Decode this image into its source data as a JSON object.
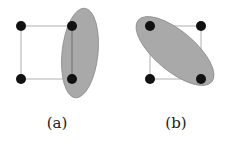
{
  "panels": [
    {
      "label": "(a)",
      "nodes": [
        {
          "id": "top-left",
          "x": 21,
          "y": 26
        },
        {
          "id": "top-right",
          "x": 72,
          "y": 26
        },
        {
          "id": "bottom-left",
          "x": 21,
          "y": 79
        },
        {
          "id": "bottom-right",
          "x": 72,
          "y": 79
        }
      ],
      "region": {
        "shape": "ellipse",
        "cx": 80,
        "cy": 53,
        "rx": 18,
        "ry": 45,
        "rotation": 6,
        "covers": [
          "top-right",
          "bottom-right"
        ]
      }
    },
    {
      "label": "(b)",
      "nodes": [
        {
          "id": "top-left",
          "x": 150,
          "y": 26
        },
        {
          "id": "top-right",
          "x": 201,
          "y": 26
        },
        {
          "id": "bottom-left",
          "x": 150,
          "y": 79
        },
        {
          "id": "bottom-right",
          "x": 201,
          "y": 79
        }
      ],
      "region": {
        "shape": "ellipse",
        "cx": 175,
        "cy": 51,
        "rx": 48,
        "ry": 20,
        "rotation": 40,
        "covers": [
          "top-left",
          "bottom-right"
        ]
      }
    }
  ],
  "colors": {
    "region_fill": "#a9a9a9",
    "edge": "#b0b0b0",
    "node": "#111111"
  }
}
